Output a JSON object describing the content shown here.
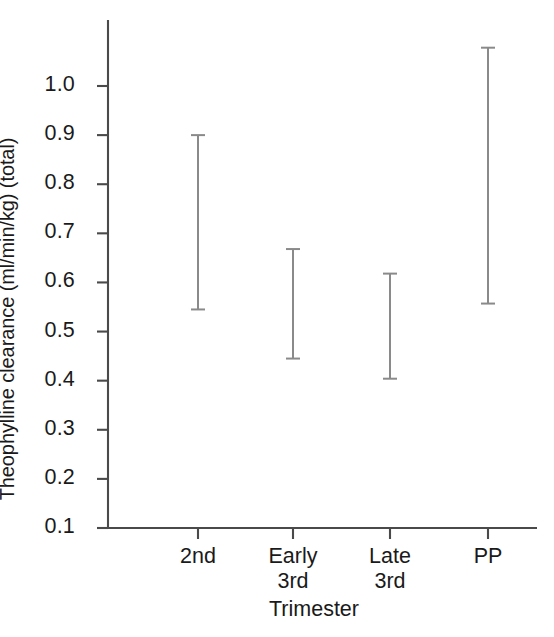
{
  "chart_data": {
    "type": "line",
    "title": "",
    "xlabel": "Trimester",
    "ylabel": "Theophylline clearance (ml/min/kg) (total)",
    "categories": [
      "2nd",
      "Early\n3rd",
      "Late\n3rd",
      "PP"
    ],
    "ytick_labels": [
      "1.0",
      "0.9",
      "0.8",
      "0.7",
      "0.6",
      "0.5",
      "0.4",
      "0.3",
      "0.2",
      "0.1"
    ],
    "ytick_values": [
      1.0,
      0.9,
      0.8,
      0.7,
      0.6,
      0.5,
      0.4,
      0.3,
      0.2,
      0.1
    ],
    "ylim": [
      0.1,
      1.0
    ],
    "grid": false,
    "legend": "none",
    "series": [
      {
        "name": "Theophylline clearance",
        "values": [
          0.728,
          0.556,
          0.503,
          0.818
        ],
        "error_upper": [
          0.9,
          0.668,
          0.618,
          1.078
        ],
        "error_lower": [
          0.545,
          0.445,
          0.404,
          0.557
        ],
        "marker": "filled-circle",
        "line_styles": [
          "solid",
          "solid",
          "dashed"
        ]
      }
    ],
    "points": [
      {
        "category": "2nd",
        "value": 0.728,
        "ci_low": 0.545,
        "ci_high": 0.9
      },
      {
        "category": "Early 3rd",
        "value": 0.556,
        "ci_low": 0.445,
        "ci_high": 0.668
      },
      {
        "category": "Late 3rd",
        "value": 0.503,
        "ci_low": 0.404,
        "ci_high": 0.618
      },
      {
        "category": "PP",
        "value": 0.818,
        "ci_low": 0.557,
        "ci_high": 1.078
      }
    ],
    "colors": {
      "line": "#111111",
      "marker": "#0d0d0d",
      "error_bar": "#8a8a8a",
      "axis": "#4a4a4a",
      "background": "#ffffff",
      "text": "#1a1a1a"
    }
  }
}
